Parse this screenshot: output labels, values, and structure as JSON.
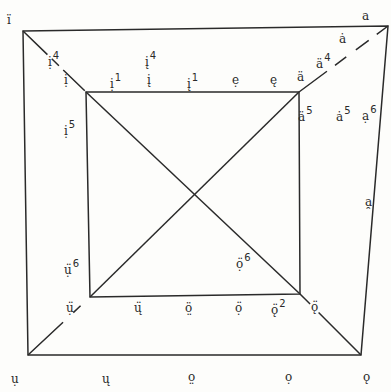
{
  "diagram": {
    "type": "vowel-quadrilateral",
    "line_color": "#2a2a2a",
    "outer_square": {
      "tl": [
        23,
        31
      ],
      "tr": [
        388,
        26
      ],
      "br": [
        361,
        355
      ],
      "bl": [
        28,
        355
      ]
    },
    "inner_square": {
      "tl": [
        86,
        92
      ],
      "tr": [
        299,
        92
      ],
      "br": [
        300,
        294
      ],
      "bl": [
        90,
        297
      ]
    },
    "labels": [
      {
        "id": "outer-tl",
        "base": "ï",
        "sup": "",
        "x": 7,
        "y": 14
      },
      {
        "id": "diag-tl-4",
        "base": "ị",
        "sup": "4",
        "x": 48,
        "y": 52
      },
      {
        "id": "diag-tl",
        "base": "ị",
        "sup": "",
        "x": 64,
        "y": 74
      },
      {
        "id": "top-1a",
        "base": "ị",
        "sup": "1",
        "x": 110,
        "y": 74
      },
      {
        "id": "top-4",
        "base": "į",
        "sup": "4",
        "x": 145,
        "y": 52
      },
      {
        "id": "top-i",
        "base": "į",
        "sup": "",
        "x": 147,
        "y": 74
      },
      {
        "id": "top-1b",
        "base": "į",
        "sup": "1",
        "x": 187,
        "y": 74
      },
      {
        "id": "top-e1",
        "base": "ẹ",
        "sup": "",
        "x": 232,
        "y": 74
      },
      {
        "id": "top-e2",
        "base": "ę",
        "sup": "",
        "x": 270,
        "y": 74
      },
      {
        "id": "diag-tr",
        "base": "ä",
        "sup": "",
        "x": 297,
        "y": 71
      },
      {
        "id": "diag-tr-4",
        "base": "ä",
        "sup": "4",
        "x": 316,
        "y": 54
      },
      {
        "id": "outer-tr-a-dot",
        "base": "ȧ",
        "sup": "",
        "x": 339,
        "y": 33
      },
      {
        "id": "outer-tr",
        "base": "a",
        "sup": "",
        "x": 362,
        "y": 10
      },
      {
        "id": "left-5",
        "base": "ị",
        "sup": "5",
        "x": 64,
        "y": 121
      },
      {
        "id": "inner-right-5",
        "base": "ä",
        "sup": "5",
        "x": 298,
        "y": 107
      },
      {
        "id": "mid-right-5",
        "base": "ȧ",
        "sup": "5",
        "x": 336,
        "y": 107
      },
      {
        "id": "outer-right-6",
        "base": "ạ",
        "sup": "6",
        "x": 362,
        "y": 106
      },
      {
        "id": "outer-right-a",
        "base": "a̯",
        "sup": "",
        "x": 365,
        "y": 196
      },
      {
        "id": "left-6",
        "base": "ụ̈",
        "sup": "6",
        "x": 64,
        "y": 260
      },
      {
        "id": "inner-br-6",
        "base": "ọ̈",
        "sup": "6",
        "x": 236,
        "y": 254
      },
      {
        "id": "diag-bl",
        "base": "ụ̈",
        "sup": "",
        "x": 66,
        "y": 302
      },
      {
        "id": "bot-u",
        "base": "ų̈",
        "sup": "",
        "x": 134,
        "y": 302
      },
      {
        "id": "bot-o1",
        "base": "ö̤",
        "sup": "",
        "x": 185,
        "y": 302
      },
      {
        "id": "bot-o2",
        "base": "ọ̈",
        "sup": "",
        "x": 235,
        "y": 302
      },
      {
        "id": "bot-o2-2",
        "base": "ǫ̈",
        "sup": "2",
        "x": 271,
        "y": 300
      },
      {
        "id": "diag-br",
        "base": "ǫ̈",
        "sup": "",
        "x": 311,
        "y": 301
      },
      {
        "id": "outer-bl",
        "base": "ụ",
        "sup": "",
        "x": 11,
        "y": 373
      },
      {
        "id": "outer-bot-u",
        "base": "ų",
        "sup": "",
        "x": 102,
        "y": 373
      },
      {
        "id": "outer-bot-o1",
        "base": "o̤",
        "sup": "",
        "x": 188,
        "y": 371
      },
      {
        "id": "outer-bot-o2",
        "base": "ọ",
        "sup": "",
        "x": 285,
        "y": 371
      },
      {
        "id": "outer-br",
        "base": "ǫ",
        "sup": "",
        "x": 363,
        "y": 371
      }
    ]
  }
}
